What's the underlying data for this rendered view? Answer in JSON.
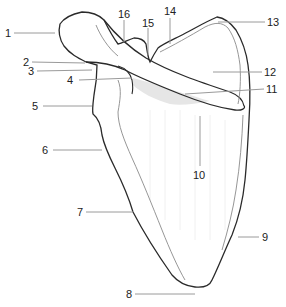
{
  "diagram": {
    "colors": {
      "outline": "#2a2a2a",
      "inner_line": "#8a8a8a",
      "leader": "#9a9a9a",
      "shading": "#e6e6e6",
      "label": "#222222"
    },
    "labels": [
      {
        "id": "1",
        "text": "1",
        "x": 5,
        "y": 28
      },
      {
        "id": "2",
        "text": "2",
        "x": 23,
        "y": 57
      },
      {
        "id": "3",
        "text": "3",
        "x": 28,
        "y": 67
      },
      {
        "id": "4",
        "text": "4",
        "x": 66,
        "y": 75
      },
      {
        "id": "5",
        "text": "5",
        "x": 31,
        "y": 101
      },
      {
        "id": "6",
        "text": "6",
        "x": 42,
        "y": 145
      },
      {
        "id": "7",
        "text": "7",
        "x": 77,
        "y": 207
      },
      {
        "id": "8",
        "text": "8",
        "x": 126,
        "y": 289
      },
      {
        "id": "9",
        "text": "9",
        "x": 262,
        "y": 233
      },
      {
        "id": "10",
        "text": "10",
        "x": 193,
        "y": 171
      },
      {
        "id": "11",
        "text": "11",
        "x": 267,
        "y": 85
      },
      {
        "id": "12",
        "text": "12",
        "x": 264,
        "y": 67
      },
      {
        "id": "13",
        "text": "13",
        "x": 267,
        "y": 17
      },
      {
        "id": "14",
        "text": "14",
        "x": 165,
        "y": 7
      },
      {
        "id": "15",
        "text": "15",
        "x": 143,
        "y": 18
      },
      {
        "id": "16",
        "text": "16",
        "x": 119,
        "y": 9
      }
    ]
  }
}
